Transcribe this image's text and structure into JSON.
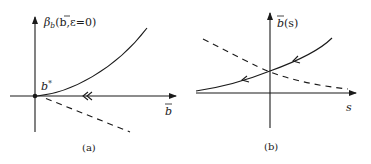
{
  "panel_a": {
    "caption": "(a)",
    "y_label_beta": "β",
    "y_label_sub": "b",
    "y_label_args": "(b,ε=0)",
    "y_label_bar_char": "b",
    "fixed_point_label": "b",
    "fixed_point_sup": "*",
    "x_label": "b",
    "flow_arrow": "double-left-arrow"
  },
  "panel_b": {
    "caption": "(b)",
    "y_label": "b",
    "y_label_args": "(s)",
    "x_label": "s",
    "flow_arrows": [
      "left-arrow",
      "left-arrow"
    ]
  },
  "colors": {
    "stroke": "#1a1a1a",
    "background": "#ffffff"
  }
}
